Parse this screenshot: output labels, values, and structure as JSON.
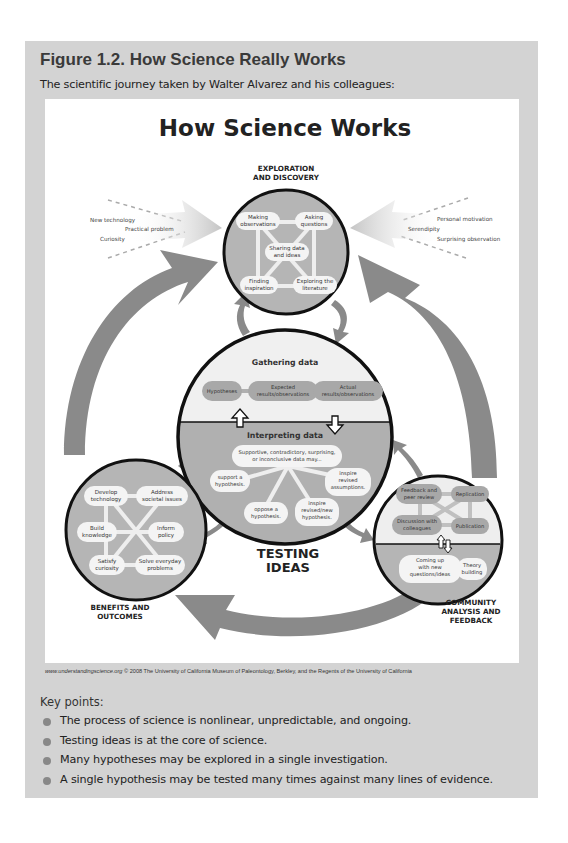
{
  "figure": {
    "title": "Figure 1.2. How Science Really Works",
    "subtitle": "The scientific journey taken by Walter Alvarez and his colleagues:"
  },
  "diagram": {
    "title": "How Science Works",
    "exploration": {
      "label_line1": "EXPLORATION",
      "label_line2": "AND DISCOVERY",
      "nodes": {
        "making_observations": [
          "Making",
          "observations"
        ],
        "asking_questions": [
          "Asking",
          "questions"
        ],
        "sharing_data": [
          "Sharing data",
          "and ideas"
        ],
        "finding_inspiration": [
          "Finding",
          "inspiration"
        ],
        "exploring_literature": [
          "Exploring the",
          "literature"
        ]
      }
    },
    "left_inputs": [
      "New technology",
      "Practical problem",
      "Curiosity"
    ],
    "right_inputs": [
      "Personal motivation",
      "Serendipity",
      "Surprising observation"
    ],
    "testing": {
      "label_line1": "TESTING",
      "label_line2": "IDEAS",
      "gathering_title": "Gathering data",
      "gathering_nodes": {
        "hypotheses": [
          "Hypotheses"
        ],
        "expected": [
          "Expected",
          "results/observations"
        ],
        "actual": [
          "Actual",
          "results/observations"
        ]
      },
      "interpreting_title": "Interpreting data",
      "interpreting_nodes": {
        "data_may": [
          "Supportive, contradictory, surprising,",
          "or inconclusive data may..."
        ],
        "support": [
          "support a",
          "hypothesis."
        ],
        "oppose": [
          "oppose a",
          "hypothesis."
        ],
        "inspire_new": [
          "inspire",
          "revised/new",
          "hypothesis."
        ],
        "inspire_assumptions": [
          "inspire",
          "revised",
          "assumptions."
        ]
      }
    },
    "benefits": {
      "label_line1": "BENEFITS AND",
      "label_line2": "OUTCOMES",
      "nodes": {
        "develop_technology": [
          "Develop",
          "technology"
        ],
        "address_issues": [
          "Address",
          "societal issues"
        ],
        "build_knowledge": [
          "Build",
          "knowledge"
        ],
        "inform_policy": [
          "Inform",
          "policy"
        ],
        "satisfy_curiosity": [
          "Satisfy",
          "curiosity"
        ],
        "solve_problems": [
          "Solve everyday",
          "problems"
        ]
      }
    },
    "community": {
      "label_line1": "COMMUNITY",
      "label_line2": "ANALYSIS AND",
      "label_line3": "FEEDBACK",
      "nodes": {
        "feedback_review": [
          "Feedback and",
          "peer review"
        ],
        "replication": [
          "Replication"
        ],
        "discussion": [
          "Discussion with",
          "colleagues"
        ],
        "publication": [
          "Publication"
        ],
        "new_questions": [
          "Coming up",
          "with new",
          "questions/ideas"
        ],
        "theory_building": [
          "Theory",
          "building"
        ]
      }
    }
  },
  "credit": {
    "site": "www.understandingscience.org",
    "text": " © 2008 The University of California Museum of Paleontology, Berkley, and the Regents of the University of California"
  },
  "key_points": {
    "title": "Key points:",
    "items": [
      "The process of science is nonlinear, unpredictable, and ongoing.",
      "Testing ideas is at the core of science.",
      "Many hypotheses may be explored in a single investigation.",
      "A single hypothesis may be tested many times against many lines of evidence."
    ]
  },
  "colors": {
    "panel": "#d3d3d3",
    "circle_fill": "#b0b0b0",
    "circle_light": "#eeeeee",
    "arrow": "#8a8a8a",
    "node": "#f4f4f4",
    "node_dark": "#9a9a9a"
  }
}
